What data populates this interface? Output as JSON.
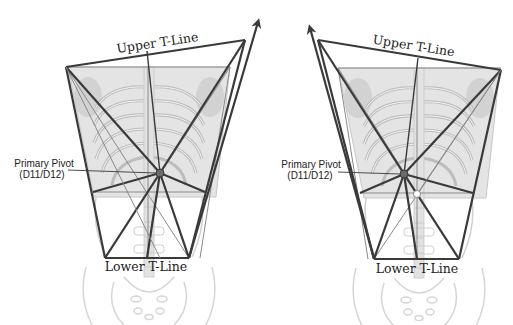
{
  "labels": {
    "upper": "Upper T-Line",
    "lower": "Lower T-Line",
    "pivot_line1": "Primary Pivot",
    "pivot_line2": "(D11/D12)"
  },
  "colors": {
    "line": "#3a3a3a",
    "thin_line": "#8a8a8a",
    "skeleton_fill": "#dcdcdc",
    "skeleton_stroke": "#c4c4c4",
    "pivot": "#6a6a6a"
  },
  "figures": [
    {
      "side": "left",
      "description": "Torso rotated with T-line frame tilted, arrow to upper-right"
    },
    {
      "side": "right",
      "description": "Torso rotated with T-line frame tilted, arrow to upper-left"
    }
  ]
}
